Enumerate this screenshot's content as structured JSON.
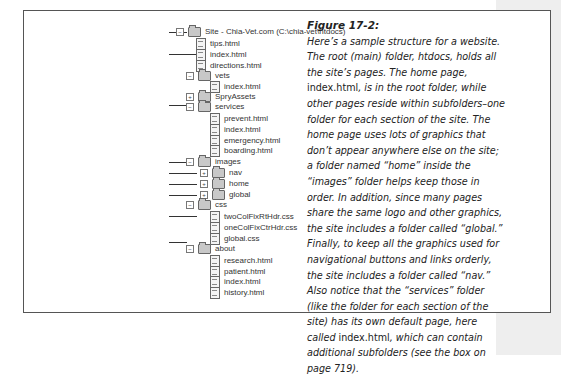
{
  "figure": {
    "title": "Figure 17-2:",
    "caption_parts": [
      {
        "text": "Here’s a sample structure for a website. The root (main) folder, htdocs, holds all the site’s pages. The home page, ",
        "italic": true
      },
      {
        "text": "index.html",
        "italic": false
      },
      {
        "text": ", is in the root folder, while other pages reside within subfolders–one folder for each section of the site. The home page uses lots of graphics that don’t appear anywhere else on the site; a folder named “home” inside the “images” folder helps keep those in order. In addition, since many pages share the same logo and other graphics, the site includes a folder called “global.” Finally, to keep all the graphics used for navigational buttons and links orderly, the site includes a folder called “nav.” Also notice that the “services” folder (like the folder for each section of the site) has its own default page, here called ",
        "italic": true
      },
      {
        "text": "index.html",
        "italic": false
      },
      {
        "text": ", which can contain additional subfolders (see the box on page 719).",
        "italic": true
      }
    ]
  },
  "callouts": [
    {
      "label": "Root folder",
      "y": 32,
      "target_x": 186
    },
    {
      "label": "Home page",
      "y": 56,
      "target_x": 196
    },
    {
      "label": "One section of the site",
      "y": 112,
      "target_x": 186
    },
    {
      "label": "Graphics",
      "y": 175,
      "target_x": 186
    },
    {
      "label": "Navigation graphics",
      "y": 187,
      "target_x": 196
    },
    {
      "label": "Graphics used on home page",
      "y": 199,
      "target_x": 196
    },
    {
      "label": "Graphics used throughout site",
      "y": 211,
      "target_x": 196
    },
    {
      "label": "CSS files",
      "y": 234,
      "target_x": 196
    },
    {
      "label": "Another section of the site",
      "y": 263,
      "target_x": 186
    }
  ],
  "tree": [
    {
      "label": "Site - Chia-Vet.com (C:\\chia-vet\\htdocs)",
      "type": "folder",
      "expander": "−",
      "level": 0,
      "y": 32
    },
    {
      "label": "tips.html",
      "type": "file",
      "level": 1,
      "y": 44
    },
    {
      "label": "index.html",
      "type": "file",
      "level": 1,
      "y": 56
    },
    {
      "label": "directions.html",
      "type": "file",
      "level": 1,
      "y": 68
    },
    {
      "label": "vets",
      "type": "folder",
      "expander": "−",
      "level": 1,
      "y": 80
    },
    {
      "label": "index.html",
      "type": "file",
      "level": 2,
      "y": 91
    },
    {
      "label": "SpryAssets",
      "type": "folder",
      "expander": "+",
      "level": 1,
      "y": 103
    },
    {
      "label": "services",
      "type": "folder",
      "expander": "−",
      "level": 1,
      "y": 114
    },
    {
      "label": "prevent.html",
      "type": "file",
      "level": 2,
      "y": 126
    },
    {
      "label": "index.html",
      "type": "file",
      "level": 2,
      "y": 138
    },
    {
      "label": "emergency.html",
      "type": "file",
      "level": 2,
      "y": 150
    },
    {
      "label": "boarding.html",
      "type": "file",
      "level": 2,
      "y": 162
    },
    {
      "label": "images",
      "type": "folder",
      "expander": "−",
      "level": 1,
      "y": 175
    },
    {
      "label": "nav",
      "type": "folder",
      "expander": "+",
      "level": 2,
      "y": 187
    },
    {
      "label": "home",
      "type": "folder",
      "expander": "+",
      "level": 2,
      "y": 199
    },
    {
      "label": "global",
      "type": "folder",
      "expander": "+",
      "level": 2,
      "y": 211
    },
    {
      "label": "css",
      "type": "folder",
      "expander": "−",
      "level": 1,
      "y": 222
    },
    {
      "label": "twoColFixRtHdr.css",
      "type": "file",
      "level": 2,
      "y": 234
    },
    {
      "label": "oneColFixCtrHdr.css",
      "type": "file",
      "level": 2,
      "y": 246
    },
    {
      "label": "global.css",
      "type": "file",
      "level": 2,
      "y": 258
    },
    {
      "label": "about",
      "type": "folder",
      "expander": "−",
      "level": 1,
      "y": 270
    },
    {
      "label": "research.html",
      "type": "file",
      "level": 2,
      "y": 282
    },
    {
      "label": "patient.html",
      "type": "file",
      "level": 2,
      "y": 294
    },
    {
      "label": "index.html",
      "type": "file",
      "level": 2,
      "y": 306
    },
    {
      "label": "history.html",
      "type": "file",
      "level": 2,
      "y": 318
    }
  ]
}
